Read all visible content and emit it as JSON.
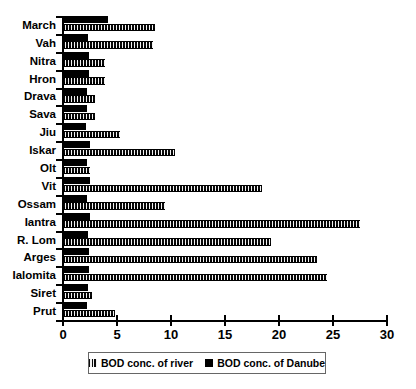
{
  "chart_data": {
    "type": "bar",
    "orientation": "horizontal",
    "title": "",
    "xlabel": "",
    "ylabel": "",
    "xlim": [
      0,
      30
    ],
    "xticks": [
      0,
      5,
      10,
      15,
      20,
      25,
      30
    ],
    "grid": false,
    "legend_position": "bottom",
    "categories": [
      "March",
      "Vah",
      "Nitra",
      "Hron",
      "Drava",
      "Sava",
      "Jiu",
      "Iskar",
      "Olt",
      "Vit",
      "Ossam",
      "Iantra",
      "R. Lom",
      "Arges",
      "Ialomita",
      "Siret",
      "Prut"
    ],
    "series": [
      {
        "name": "BOD conc. of Danube",
        "pattern": "solid-black",
        "values": [
          4.2,
          2.3,
          2.4,
          2.4,
          2.2,
          2.2,
          2.1,
          2.5,
          2.2,
          2.5,
          2.2,
          2.5,
          2.3,
          2.4,
          2.4,
          2.3,
          2.2
        ]
      },
      {
        "name": "BOD conc. of river",
        "pattern": "hatched-black",
        "values": [
          8.5,
          8.3,
          3.9,
          3.9,
          3.0,
          3.0,
          5.3,
          10.4,
          2.5,
          18.4,
          9.4,
          27.5,
          19.3,
          23.5,
          24.4,
          2.7,
          4.8
        ]
      }
    ]
  },
  "legend": {
    "entries": [
      {
        "label": "BOD conc. of river"
      },
      {
        "label": "BOD conc. of Danube"
      }
    ]
  }
}
